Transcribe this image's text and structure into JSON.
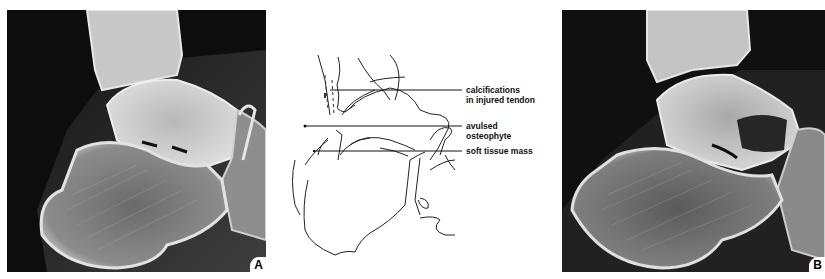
{
  "figure": {
    "panels": [
      {
        "id": "A",
        "label": "A",
        "type": "radiograph",
        "view": "lateral ankle/hindfoot"
      },
      {
        "id": "diagram",
        "type": "line-drawing tracing"
      },
      {
        "id": "B",
        "label": "B",
        "type": "radiograph",
        "view": "lateral ankle/hindfoot"
      }
    ],
    "callouts": [
      {
        "line1": "calcifications",
        "line2": "in injured tendon"
      },
      {
        "line1": "avulsed",
        "line2": "osteophyte"
      },
      {
        "line1": "soft tissue mass",
        "line2": ""
      }
    ]
  }
}
